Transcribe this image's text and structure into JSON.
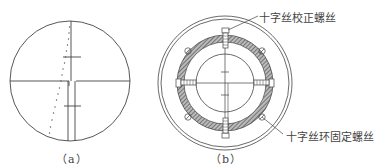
{
  "figure_a": {
    "caption": "（a）",
    "description": "reticle view with crosshair and dotted offset line"
  },
  "figure_b": {
    "caption": "（b）",
    "callouts": {
      "top": "十字丝校正螺丝",
      "bottom": "十字丝环固定螺丝"
    }
  },
  "colors": {
    "line": "#444444",
    "hatch": "#666666",
    "background": "#ffffff"
  }
}
